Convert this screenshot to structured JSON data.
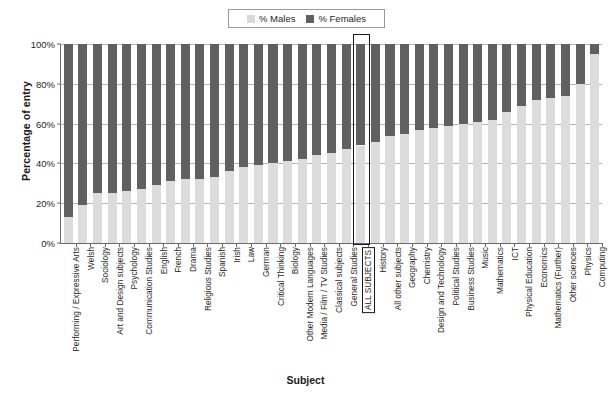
{
  "legend": {
    "position": "top-center",
    "entries": [
      {
        "label": "% Males",
        "color": "#d9d9d9"
      },
      {
        "label": "% Females",
        "color": "#606060"
      }
    ]
  },
  "axes": {
    "ylabel": "Percentage of entry",
    "xlabel": "Subject",
    "yticks": [
      "0%",
      "20%",
      "40%",
      "60%",
      "80%",
      "100%"
    ]
  },
  "highlight": {
    "category": "ALL SUBJECTS"
  },
  "chart_data": {
    "type": "bar",
    "stacked": true,
    "title": "",
    "subtitle": "",
    "xlabel": "Subject",
    "ylabel": "Percentage of entry",
    "ylim": [
      0,
      100
    ],
    "yticks": [
      0,
      20,
      40,
      60,
      80,
      100
    ],
    "ytick_labels": [
      "0%",
      "20%",
      "40%",
      "60%",
      "80%",
      "100%"
    ],
    "grid": true,
    "legend_position": "top-center",
    "annotations": [
      "ALL SUBJECTS column outlined with a black box"
    ],
    "categories": [
      "Performing / Expressive Arts",
      "Welsh",
      "Sociology",
      "Art and Design subjects",
      "Psychology",
      "Communication Studies",
      "English",
      "French",
      "Drama",
      "Religious Studies",
      "Spanish",
      "Irish",
      "Law",
      "German",
      "Critical Thinking",
      "Biology",
      "Other Modern Languages",
      "Media / Film / TV Studies",
      "Classical subjects",
      "General Studies",
      "ALL SUBJECTS",
      "History",
      "All other subjects",
      "Geography",
      "Chemistry",
      "Design and Technology",
      "Political Studies",
      "Business Studies",
      "Music",
      "Mathematics",
      "ICT",
      "Physical Education",
      "Economics",
      "Mathematics (Further)",
      "Other sciences",
      "Physics",
      "Computing"
    ],
    "series": [
      {
        "name": "% Males",
        "color": "#d9d9d9",
        "values": [
          13,
          19,
          25,
          25,
          26,
          27,
          29,
          31,
          32,
          32,
          33,
          36,
          38,
          39,
          40,
          41,
          42,
          44,
          45,
          47,
          49,
          51,
          54,
          55,
          57,
          58,
          59,
          60,
          61,
          62,
          66,
          69,
          72,
          73,
          74,
          80,
          95
        ]
      },
      {
        "name": "% Females",
        "color": "#606060",
        "values": [
          87,
          81,
          75,
          75,
          74,
          73,
          71,
          69,
          68,
          68,
          67,
          64,
          62,
          61,
          60,
          59,
          58,
          56,
          55,
          53,
          51,
          49,
          46,
          45,
          43,
          42,
          41,
          40,
          39,
          38,
          34,
          31,
          28,
          27,
          26,
          20,
          5
        ]
      }
    ]
  }
}
